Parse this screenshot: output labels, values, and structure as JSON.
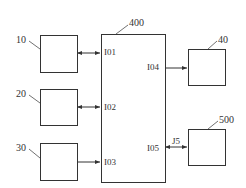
{
  "diagram": {
    "caption": "",
    "blocks": [
      {
        "id": "10",
        "label": "10"
      },
      {
        "id": "20",
        "label": "20"
      },
      {
        "id": "30",
        "label": "30"
      },
      {
        "id": "400",
        "label": "400"
      },
      {
        "id": "40",
        "label": "40"
      },
      {
        "id": "500",
        "label": "500"
      }
    ],
    "ports": {
      "p101": "I01",
      "p102": "I02",
      "p103": "I03",
      "p104": "I04",
      "p105": "I05"
    },
    "link_labels": {
      "j5": "J5"
    },
    "connections": [
      {
        "from": "10",
        "to": "400.I01",
        "type": "bidirectional"
      },
      {
        "from": "20",
        "to": "400.I02",
        "type": "bidirectional"
      },
      {
        "from": "30",
        "to": "400.I03",
        "type": "unidirectional"
      },
      {
        "from": "400.I04",
        "to": "40",
        "type": "unidirectional"
      },
      {
        "from": "400.I05",
        "to": "500",
        "type": "bidirectional",
        "label": "J5"
      }
    ],
    "colors": {
      "stroke": "#333333",
      "background": "#ffffff"
    }
  }
}
